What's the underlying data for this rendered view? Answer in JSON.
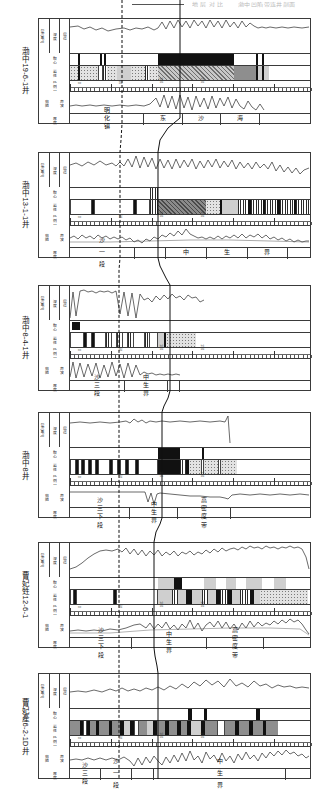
{
  "figure": {
    "type": "well-log-correlation-section",
    "orientation_note": "page rotated 90 degrees; labels read vertically",
    "well_count": 6,
    "top_fragments": [
      "地 层  对 比",
      "渤中凹陷带连井剖面"
    ]
  },
  "track_headers": {
    "curve_top": [
      "GR(API)",
      "深度",
      "层位"
    ],
    "sample": "取心",
    "lithology": "岩性",
    "scale": "比 例 尺",
    "curve_bottom": [
      "电阻",
      "声波"
    ],
    "thickness": "厚度",
    "formation": "层位"
  },
  "correlation_lines": [
    {
      "name": "dashed-marker",
      "style": "dashed"
    },
    {
      "name": "solid-marker",
      "style": "solid"
    }
  ],
  "panels": [
    {
      "well": "渤中19-6-1井",
      "formations": [
        {
          "label": "明化镇",
          "start": 0,
          "width": 31
        },
        {
          "label": "东",
          "start": 31,
          "width": 16
        },
        {
          "label": "沙",
          "start": 47,
          "width": 16
        },
        {
          "label": "海",
          "start": 63,
          "width": 16
        },
        {
          "label": "",
          "start": 79,
          "width": 21
        }
      ]
    },
    {
      "well": "渤中13-1-1井",
      "formations": [
        {
          "label": "沙 一 段",
          "start": 0,
          "width": 27
        },
        {
          "label": "",
          "start": 27,
          "width": 13
        },
        {
          "label": "中",
          "start": 40,
          "width": 17
        },
        {
          "label": "生",
          "start": 57,
          "width": 17
        },
        {
          "label": "界",
          "start": 74,
          "width": 17
        },
        {
          "label": "",
          "start": 91,
          "width": 9
        }
      ]
    },
    {
      "well": "渤中8-4-1井",
      "formations": [
        {
          "label": "沙三段",
          "start": 0,
          "width": 23
        },
        {
          "label": "中生界",
          "start": 23,
          "width": 18
        },
        {
          "label": "",
          "start": 41,
          "width": 5
        },
        {
          "label": "",
          "start": 46,
          "width": 54
        }
      ]
    },
    {
      "well": "渤中8井",
      "formations": [
        {
          "label": "沙三下段",
          "start": 0,
          "width": 25
        },
        {
          "label": "中生界",
          "start": 25,
          "width": 20
        },
        {
          "label": "高密度带",
          "start": 45,
          "width": 22
        },
        {
          "label": "",
          "start": 67,
          "width": 33
        }
      ]
    },
    {
      "well": "曹妃甡12-6-1",
      "formations": [
        {
          "label": "沙三下段",
          "start": 0,
          "width": 26
        },
        {
          "label": "中生界",
          "start": 26,
          "width": 31
        },
        {
          "label": "高密度带",
          "start": 57,
          "width": 24
        },
        {
          "label": "",
          "start": 81,
          "width": 19
        }
      ]
    },
    {
      "well": "曹妃產6-2-1D井",
      "formations": [
        {
          "label": "沙三段",
          "start": 0,
          "width": 13
        },
        {
          "label": "沙 一 段",
          "start": 13,
          "width": 13
        },
        {
          "label": "",
          "start": 26,
          "width": 9
        },
        {
          "label": "中 生 界",
          "start": 35,
          "width": 55
        },
        {
          "label": "",
          "start": 90,
          "width": 10
        }
      ]
    }
  ],
  "scale_ticks": {
    "major_labels": [
      "0",
      "50",
      "100",
      "150"
    ]
  }
}
